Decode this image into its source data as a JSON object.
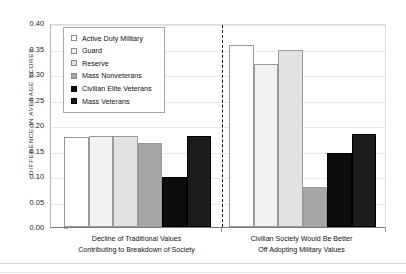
{
  "chart_data": {
    "type": "bar",
    "title": "",
    "subtitle": "",
    "xlabel": "",
    "ylabel": "Difference in Average Scores",
    "ylim": [
      0.0,
      0.4
    ],
    "ytick_labels": [
      "0.40",
      "0.35",
      "0.30",
      "0.25",
      "0.20",
      "0.15",
      "0.10",
      "0.05",
      "0.00"
    ],
    "ytick_values": [
      0.4,
      0.35,
      0.3,
      0.25,
      0.2,
      0.15,
      0.1,
      0.05,
      0.0
    ],
    "grid": true,
    "grid_axis": "y",
    "legend_position": "upper-left-inside",
    "categories": [
      "Decline of Traditional Values Contributing to Breakdown of Society",
      "Civilian Society Would Be Better Off Adopting Military Values"
    ],
    "category_label_lines": [
      [
        "Decline of Traditional Values",
        "Contributing to Breakdown of Society"
      ],
      [
        "Civilian Society Would Be Better",
        "Off Adopting Military Values"
      ]
    ],
    "series": [
      {
        "name": "Active Duty Military",
        "color": "#ffffff",
        "values": [
          0.177,
          0.357
        ]
      },
      {
        "name": "Guard",
        "color": "#f2f2f2",
        "values": [
          0.178,
          0.32
        ]
      },
      {
        "name": "Reserve",
        "color": "#e2e2e2",
        "values": [
          0.179,
          0.347
        ]
      },
      {
        "name": "Mass Nonveterans",
        "color": "#a6a6a6",
        "values": [
          0.165,
          0.079
        ]
      },
      {
        "name": "Civilian Elite Veterans",
        "color": "#0d0d0d",
        "values": [
          0.098,
          0.146
        ]
      },
      {
        "name": "Mass Veterans",
        "color": "#1c1c1c",
        "values": [
          0.178,
          0.183
        ]
      }
    ]
  },
  "axis": {
    "y_title": "Difference in Average Scores"
  },
  "legend": {
    "entries": [
      {
        "label": "Active Duty Military",
        "swatch": "#ffffff"
      },
      {
        "label": "Guard",
        "swatch": "#f2f2f2"
      },
      {
        "label": "Reserve",
        "swatch": "#e2e2e2"
      },
      {
        "label": "Mass Nonveterans",
        "swatch": "#a6a6a6"
      },
      {
        "label": "Civilian Elite Veterans",
        "swatch": "#0d0d0d"
      },
      {
        "label": "Mass Veterans",
        "swatch": "#1c1c1c"
      }
    ]
  }
}
